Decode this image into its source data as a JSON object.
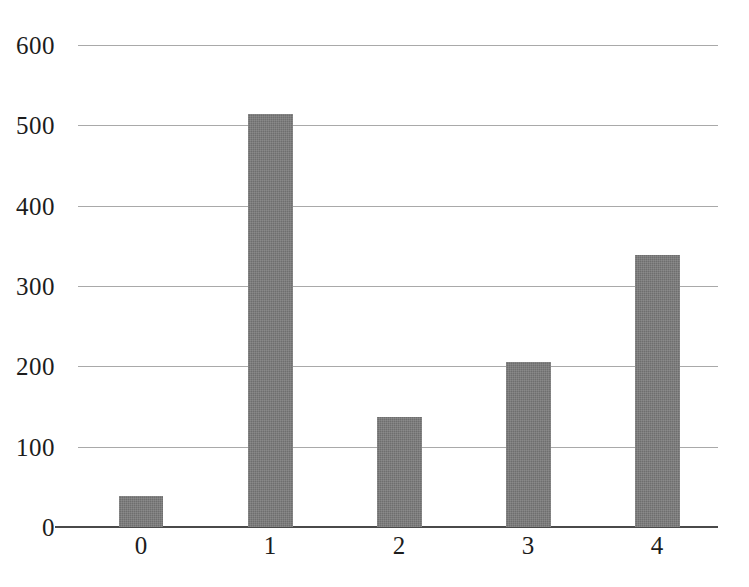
{
  "chart_data": {
    "type": "bar",
    "title": "",
    "subtitle": "",
    "xlabel": "",
    "ylabel": "",
    "categories": [
      "0",
      "1",
      "2",
      "3",
      "4"
    ],
    "values": [
      39,
      514,
      137,
      206,
      339
    ],
    "series": [
      {
        "name": "",
        "values": [
          39,
          514,
          137,
          206,
          339
        ]
      }
    ],
    "ylim": [
      0,
      600
    ],
    "yticks": [
      0,
      100,
      200,
      300,
      400,
      500,
      600
    ],
    "ytick_labels": [
      "0",
      "100",
      "200",
      "300",
      "400",
      "500",
      "600"
    ],
    "xtick_labels": [
      "0",
      "1",
      "2",
      "3",
      "4"
    ],
    "grid": true,
    "grid_axis": "y",
    "legend": false,
    "legend_position": "none",
    "bar_color": "#6e6e6e",
    "gridline_color": "#9a9a9a",
    "axis_color": "#4a4a4a",
    "text_color": "#1c1c1c",
    "background_color": "#ffffff"
  }
}
